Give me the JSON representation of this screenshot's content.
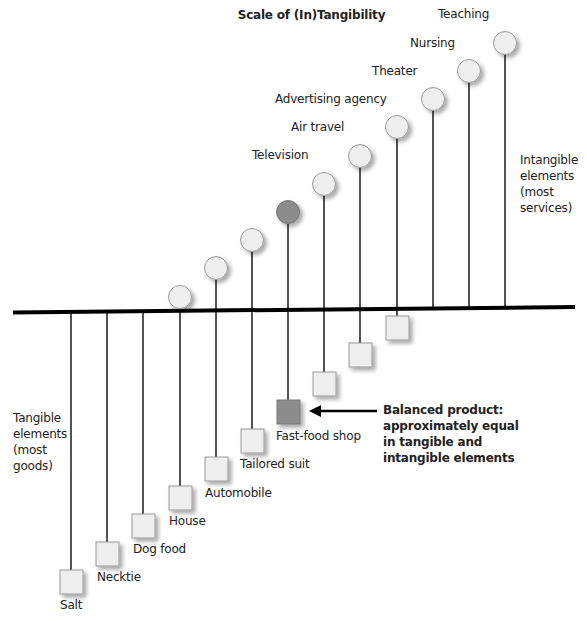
{
  "title": "Scale of (In)Tangibility",
  "colors": {
    "shape_fill": "#eeeeee",
    "shape_stroke": "#9a9a9a",
    "balanced_fill": "#8c8c8c",
    "line": "#1a1a1a",
    "baseline": "#000000"
  },
  "side_labels": {
    "intangible": [
      "Intangible",
      "elements",
      "(most",
      "services)"
    ],
    "tangible": [
      "Tangible",
      "elements",
      "(most",
      "goods)"
    ]
  },
  "balanced_note": [
    "Balanced product:",
    "approximately equal",
    "in tangible and",
    "intangible elements"
  ],
  "items": [
    {
      "name": "Salt",
      "tangible_label": "Salt",
      "intangible_label": ""
    },
    {
      "name": "Necktie",
      "tangible_label": "Necktie",
      "intangible_label": ""
    },
    {
      "name": "Dog food",
      "tangible_label": "Dog food",
      "intangible_label": ""
    },
    {
      "name": "House",
      "tangible_label": "House",
      "intangible_label": ""
    },
    {
      "name": "Automobile",
      "tangible_label": "Automobile",
      "intangible_label": ""
    },
    {
      "name": "Tailored suit",
      "tangible_label": "Tailored suit",
      "intangible_label": ""
    },
    {
      "name": "Fast-food shop",
      "tangible_label": "Fast-food shop",
      "intangible_label": ""
    },
    {
      "name": "Television",
      "tangible_label": "",
      "intangible_label": "Television"
    },
    {
      "name": "Air travel",
      "tangible_label": "",
      "intangible_label": "Air travel"
    },
    {
      "name": "Advertising agency",
      "tangible_label": "",
      "intangible_label": "Advertising agency"
    },
    {
      "name": "Theater",
      "tangible_label": "",
      "intangible_label": "Theater"
    },
    {
      "name": "Nursing",
      "tangible_label": "",
      "intangible_label": "Nursing"
    },
    {
      "name": "Teaching",
      "tangible_label": "",
      "intangible_label": "Teaching"
    }
  ],
  "labels": {
    "salt": "Salt",
    "necktie": "Necktie",
    "dog_food": "Dog food",
    "house": "House",
    "automobile": "Automobile",
    "tailored_suit": "Tailored suit",
    "fast_food_shop": "Fast-food shop",
    "television": "Television",
    "air_travel": "Air travel",
    "advertising_agency": "Advertising agency",
    "theater": "Theater",
    "nursing": "Nursing",
    "teaching": "Teaching"
  }
}
